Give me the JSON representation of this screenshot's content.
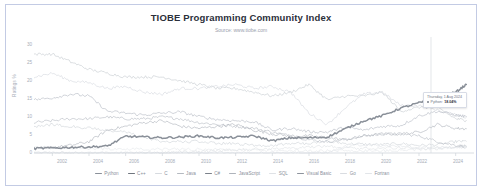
{
  "card": {
    "border_color": "#c3cbe4",
    "background": "#ffffff"
  },
  "header": {
    "title": "TIOBE Programming Community Index",
    "subtitle": "Source: www.tiobe.com"
  },
  "tooltip": {
    "date": "Thursday, 1 Aug 2024",
    "series": "Python:",
    "value": "18.04%",
    "dot_color": "#7a7f88"
  },
  "chart_data": {
    "type": "line",
    "title": "TIOBE Programming Community Index",
    "subtitle": "Source: www.tiobe.com",
    "xlabel": "",
    "ylabel": "Ratings %",
    "xlim": [
      2001,
      2025
    ],
    "ylim": [
      0,
      30
    ],
    "yticks": [
      0,
      5,
      10,
      15,
      20,
      25,
      30
    ],
    "xticks": [
      2002,
      2004,
      2006,
      2008,
      2010,
      2012,
      2014,
      2016,
      2018,
      2020,
      2022,
      2024
    ],
    "grid": false,
    "legend_position": "bottom",
    "x": [
      2001,
      2002,
      2003,
      2004,
      2005,
      2006,
      2007,
      2008,
      2009,
      2010,
      2011,
      2012,
      2013,
      2014,
      2015,
      2016,
      2017,
      2018,
      2019,
      2020,
      2021,
      2022,
      2023,
      2024,
      2024.58
    ],
    "series": [
      {
        "name": "Python",
        "color": "#8a9099",
        "values": [
          1.2,
          1.3,
          1.5,
          1.6,
          1.8,
          4.4,
          4.2,
          4.0,
          4.2,
          4.5,
          4.0,
          4.1,
          4.5,
          3.2,
          4.0,
          4.0,
          4.2,
          6.4,
          8.5,
          9.8,
          11.8,
          13.2,
          14.6,
          16.0,
          18.04
        ]
      },
      {
        "name": "C++",
        "color": "#b6bcc4",
        "values": [
          14.0,
          14.5,
          15.5,
          15.0,
          11.0,
          10.5,
          10.0,
          10.5,
          10.8,
          9.6,
          8.8,
          8.5,
          8.2,
          6.0,
          6.5,
          5.6,
          5.5,
          6.8,
          6.0,
          7.0,
          7.2,
          9.8,
          11.0,
          10.0,
          9.6
        ]
      },
      {
        "name": "C",
        "color": "#d6dadf",
        "values": [
          20.0,
          21.0,
          19.0,
          18.5,
          17.0,
          17.5,
          16.0,
          15.5,
          17.0,
          17.0,
          17.5,
          18.0,
          17.0,
          17.5,
          16.0,
          10.5,
          7.5,
          12.0,
          15.5,
          16.0,
          12.5,
          12.5,
          11.3,
          10.0,
          9.4
        ]
      },
      {
        "name": "Java",
        "color": "#c8ccd2"
      },
      {
        "name": "C#",
        "color": "#b0b5bd"
      },
      {
        "name": "JavaScript",
        "color": "#d0d4da"
      },
      {
        "name": "SQL",
        "color": "#e0e3e7"
      },
      {
        "name": "Visual Basic",
        "color": "#b8bdc4"
      },
      {
        "name": "Go",
        "color": "#dfe2e6"
      },
      {
        "name": "Fortran",
        "color": "#e4e7ea"
      }
    ]
  },
  "legend": {
    "items": [
      {
        "label": "Python",
        "color": "#8a9099"
      },
      {
        "label": "C++",
        "color": "#6f757e"
      },
      {
        "label": "C",
        "color": "#d6dadf"
      },
      {
        "label": "Java",
        "color": "#b4b9c0"
      },
      {
        "label": "C#",
        "color": "#7b818a"
      },
      {
        "label": "JavaScript",
        "color": "#aeb3bb"
      },
      {
        "label": "SQL",
        "color": "#dfe2e6"
      },
      {
        "label": "Visual Basic",
        "color": "#8d939c"
      },
      {
        "label": "Go",
        "color": "#d9dce1"
      },
      {
        "label": "Fortran",
        "color": "#e2e5e9"
      }
    ]
  }
}
